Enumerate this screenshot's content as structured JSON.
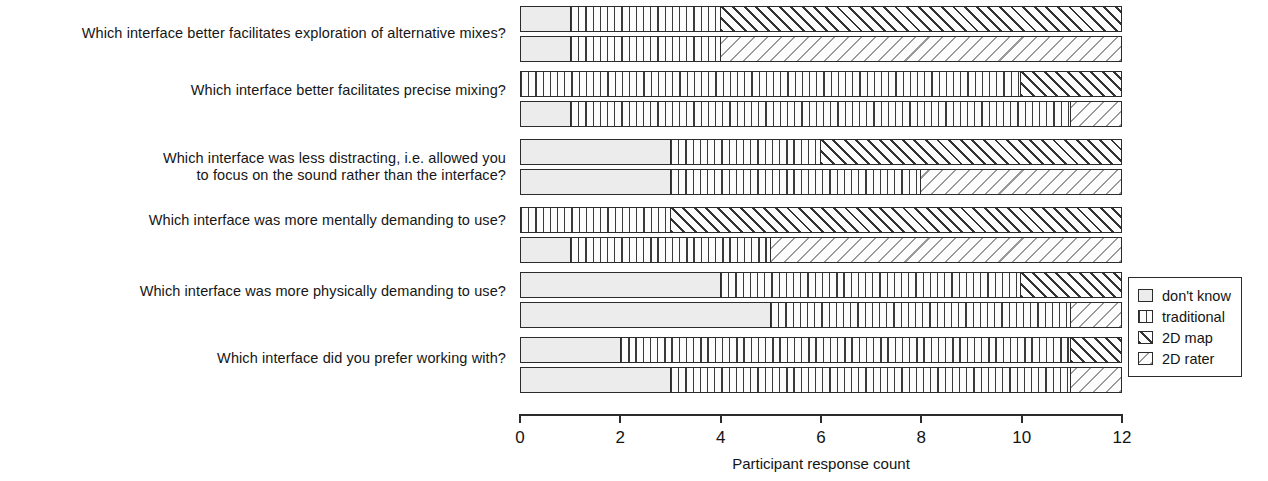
{
  "chart_data": {
    "type": "bar",
    "title": "",
    "subtitle": "",
    "xlabel": "Participant response count",
    "ylabel": "",
    "xlim": [
      0,
      12
    ],
    "xticks": [
      0,
      2,
      4,
      6,
      8,
      10,
      12
    ],
    "xtick_labels": [
      "0",
      "2",
      "4",
      "6",
      "8",
      "10",
      "12"
    ],
    "grid": false,
    "orientation": "horizontal",
    "stacked": true,
    "legend_position": "right",
    "legend": [
      "don't know",
      "traditional",
      "2D map",
      "2D rater"
    ],
    "categories": [
      "Which interface better facilitates exploration of alternative mixes?",
      "Which interface better facilitates precise mixing?",
      "Which interface was less distracting, i.e. allowed you\nto focus on the sound rather than the interface?",
      "Which interface was more mentally demanding to use?",
      "Which interface was more physically demanding to use?",
      "Which interface did you prefer working with?"
    ],
    "series": [
      {
        "name": "don't know",
        "pattern": "blank-light",
        "color": "#ececec",
        "values_map": [
          1,
          0,
          3,
          0,
          4,
          2
        ],
        "values_rater": [
          1,
          1,
          3,
          1,
          5,
          3
        ]
      },
      {
        "name": "traditional",
        "pattern": "vertical-lines",
        "color": "#3a3a3a",
        "values_map": [
          3,
          10,
          3,
          3,
          6,
          9
        ],
        "values_rater": [
          3,
          10,
          5,
          4,
          6,
          8
        ]
      },
      {
        "name": "2D map",
        "pattern": "diagonal-hatch-dark",
        "color": "#333333",
        "values_map": [
          8,
          2,
          6,
          9,
          2,
          1
        ],
        "values_rater": [
          0,
          0,
          0,
          0,
          0,
          0
        ]
      },
      {
        "name": "2D rater",
        "pattern": "diagonal-hatch-light",
        "color": "#9a9a9a",
        "values_map": [
          0,
          0,
          0,
          0,
          0,
          0
        ],
        "values_rater": [
          8,
          1,
          4,
          7,
          1,
          1
        ]
      }
    ],
    "groups": [
      {
        "category": "Which interface better facilitates exploration of alternative mixes?",
        "bars": [
          {
            "comparison": "2D map",
            "segments": [
              {
                "series": "don't know",
                "value": 1
              },
              {
                "series": "traditional",
                "value": 3
              },
              {
                "series": "2D map",
                "value": 8
              }
            ]
          },
          {
            "comparison": "2D rater",
            "segments": [
              {
                "series": "don't know",
                "value": 1
              },
              {
                "series": "traditional",
                "value": 3
              },
              {
                "series": "2D rater",
                "value": 8
              }
            ]
          }
        ]
      },
      {
        "category": "Which interface better facilitates precise mixing?",
        "bars": [
          {
            "comparison": "2D map",
            "segments": [
              {
                "series": "don't know",
                "value": 0
              },
              {
                "series": "traditional",
                "value": 10
              },
              {
                "series": "2D map",
                "value": 2
              }
            ]
          },
          {
            "comparison": "2D rater",
            "segments": [
              {
                "series": "don't know",
                "value": 1
              },
              {
                "series": "traditional",
                "value": 10
              },
              {
                "series": "2D rater",
                "value": 1
              }
            ]
          }
        ]
      },
      {
        "category": "Which interface was less distracting, i.e. allowed you to focus on the sound rather than the interface?",
        "bars": [
          {
            "comparison": "2D map",
            "segments": [
              {
                "series": "don't know",
                "value": 3
              },
              {
                "series": "traditional",
                "value": 3
              },
              {
                "series": "2D map",
                "value": 6
              }
            ]
          },
          {
            "comparison": "2D rater",
            "segments": [
              {
                "series": "don't know",
                "value": 3
              },
              {
                "series": "traditional",
                "value": 5
              },
              {
                "series": "2D rater",
                "value": 4
              }
            ]
          }
        ]
      },
      {
        "category": "Which interface was more mentally demanding to use?",
        "bars": [
          {
            "comparison": "2D map",
            "segments": [
              {
                "series": "don't know",
                "value": 0
              },
              {
                "series": "traditional",
                "value": 3
              },
              {
                "series": "2D map",
                "value": 9
              }
            ]
          },
          {
            "comparison": "2D rater",
            "segments": [
              {
                "series": "don't know",
                "value": 1
              },
              {
                "series": "traditional",
                "value": 4
              },
              {
                "series": "2D rater",
                "value": 7
              }
            ]
          }
        ]
      },
      {
        "category": "Which interface was more physically demanding to use?",
        "bars": [
          {
            "comparison": "2D map",
            "segments": [
              {
                "series": "don't know",
                "value": 4
              },
              {
                "series": "traditional",
                "value": 6
              },
              {
                "series": "2D map",
                "value": 2
              }
            ]
          },
          {
            "comparison": "2D rater",
            "segments": [
              {
                "series": "don't know",
                "value": 5
              },
              {
                "series": "traditional",
                "value": 6
              },
              {
                "series": "2D rater",
                "value": 1
              }
            ]
          }
        ]
      },
      {
        "category": "Which interface did you prefer working with?",
        "bars": [
          {
            "comparison": "2D map",
            "segments": [
              {
                "series": "don't know",
                "value": 2
              },
              {
                "series": "traditional",
                "value": 9
              },
              {
                "series": "2D map",
                "value": 1
              }
            ]
          },
          {
            "comparison": "2D rater",
            "segments": [
              {
                "series": "don't know",
                "value": 3
              },
              {
                "series": "traditional",
                "value": 8
              },
              {
                "series": "2D rater",
                "value": 1
              }
            ]
          }
        ]
      }
    ]
  },
  "layout": {
    "plot_left": 520,
    "plot_right": 1122,
    "axis_y": 414,
    "label_right": 506,
    "group_tops": [
      6,
      71,
      139,
      207,
      272,
      337
    ],
    "bar_height": 26,
    "bar_gap": 4,
    "legend_left": 1128,
    "legend_top": 277
  }
}
